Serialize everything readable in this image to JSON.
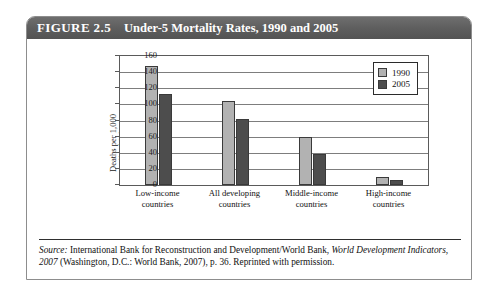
{
  "figure": {
    "number": "FIGURE 2.5",
    "title": "Under-5 Mortality Rates, 1990 and 2005"
  },
  "source": {
    "label": "Source:",
    "text_1": " International Bank for Reconstruction and Development/World Bank, ",
    "italic_1": "World Development Indicators, 2007",
    "text_2": " (Washington, D.C.: World Bank, 2007), p. 36. Reprinted with permission."
  },
  "colors": {
    "series_1990": "#b2b2b2",
    "series_2005": "#4d4d4d",
    "header_bar": "#5d5d5d",
    "grid": "#7d7d7d"
  },
  "chart_data": {
    "type": "bar",
    "title": "Under-5 Mortality Rates, 1990 and 2005",
    "xlabel": "",
    "ylabel": "Deaths per 1,000 live births",
    "ylabel_line_1": "Deaths per 1,000",
    "ylabel_line_2": "live births",
    "ylim": [
      0,
      160
    ],
    "ytick_step": 20,
    "yticks": [
      160,
      140,
      120,
      100,
      80,
      60,
      40,
      20,
      0
    ],
    "grid": true,
    "legend_position": "top-right",
    "categories": [
      "Low-income countries",
      "All developing countries",
      "Middle-income countries",
      "High-income countries"
    ],
    "category_lines": [
      [
        "Low-income",
        "countries"
      ],
      [
        "All developing",
        "countries"
      ],
      [
        "Middle-income",
        "countries"
      ],
      [
        "High-income",
        "countries"
      ]
    ],
    "series": [
      {
        "name": "1990",
        "values": [
          148,
          104,
          60,
          10
        ]
      },
      {
        "name": "2005",
        "values": [
          113,
          82,
          38,
          6
        ]
      }
    ]
  }
}
